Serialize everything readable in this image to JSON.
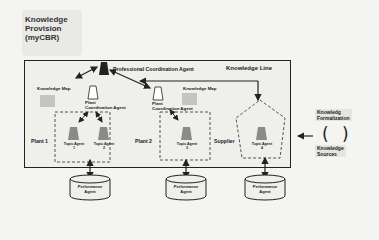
{
  "header": {
    "title_line1": "Knowledge",
    "title_line2": "Provision",
    "title_line3": "(myCBR)"
  },
  "main": {
    "professional_agent": "Professional Coordination Agent",
    "knowledge_line": "Knowledge Line",
    "knowledge_map_left": "Knowledge Map",
    "knowledge_map_right": "Knowledge Map",
    "plant_coord_1_line1": "Plant",
    "plant_coord_1_line2": "Coordination Agent",
    "plant_coord_2_line1": "Plant",
    "plant_coord_2_line2": "Coordination Agent",
    "plant1": "Plant 1",
    "plant2": "Plant 2",
    "supplier": "Supplier",
    "topic_agents": [
      {
        "label": "Topic Agent",
        "num": "1"
      },
      {
        "label": "Topic Agent",
        "num": "2"
      },
      {
        "label": "Topic Agent",
        "num": "3"
      },
      {
        "label": "Topic Agent",
        "num": "4"
      }
    ]
  },
  "performance_agents": [
    {
      "line1": "Performance",
      "line2": "Agent"
    },
    {
      "line1": "Performance",
      "line2": "Agent"
    },
    {
      "line1": "Performance",
      "line2": "Agent"
    }
  ],
  "side": {
    "formalization_line1": "Knowledg",
    "formalization_line2": "Formalization",
    "sources_line1": "Knowledge",
    "sources_line2": "Sources",
    "bracket": "( )"
  },
  "colors": {
    "background": "#f4f4f2",
    "box_border": "#222222",
    "topic_agent_fill": "#8a8a8a",
    "professional_agent_fill": "#222222",
    "knowledge_map_fill": "#c4c4c2",
    "dashed": "#555555"
  }
}
